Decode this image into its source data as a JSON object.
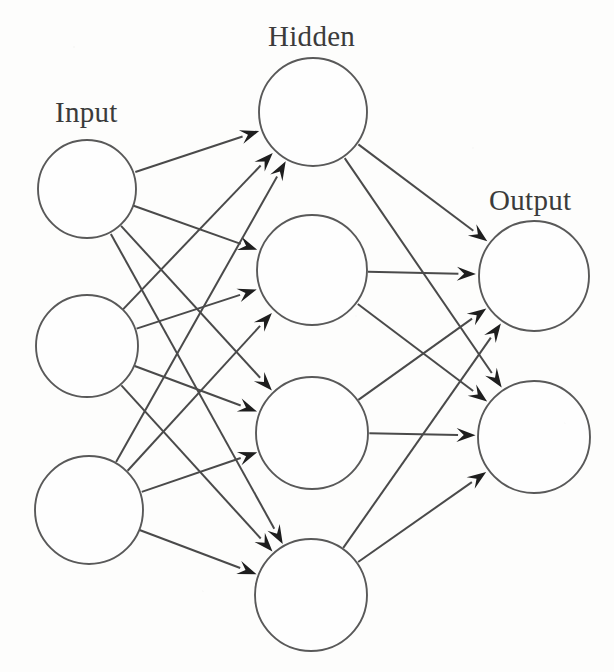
{
  "figure": {
    "type": "neural-network-diagram",
    "title": "",
    "background_color": "#fdfdfc",
    "stroke_color": "#4a4a4a",
    "node_fill_color": "#fefefe",
    "node_stroke_color": "#595959",
    "arrowhead_color": "#1e1e1e",
    "label_color": "#3b3b3b",
    "canvas": {
      "width": 614,
      "height": 672
    }
  },
  "labels": {
    "input": "Input",
    "hidden": "Hidden",
    "output": "Output"
  },
  "label_positions": {
    "input": {
      "x": 55,
      "y": 98
    },
    "hidden": {
      "x": 268,
      "y": 22
    },
    "output": {
      "x": 489,
      "y": 186
    }
  },
  "layers": [
    {
      "id": "input",
      "name": "Input",
      "node_count": 3,
      "nodes": [
        {
          "id": "i1",
          "cx": 87,
          "cy": 189,
          "r": 49
        },
        {
          "id": "i2",
          "cx": 87,
          "cy": 346,
          "r": 51
        },
        {
          "id": "i3",
          "cx": 89,
          "cy": 510,
          "r": 54
        }
      ]
    },
    {
      "id": "hidden",
      "name": "Hidden",
      "node_count": 4,
      "nodes": [
        {
          "id": "h1",
          "cx": 313,
          "cy": 112,
          "r": 54
        },
        {
          "id": "h2",
          "cx": 312,
          "cy": 270,
          "r": 55
        },
        {
          "id": "h3",
          "cx": 312,
          "cy": 433,
          "r": 56
        },
        {
          "id": "h4",
          "cx": 311,
          "cy": 595,
          "r": 56
        }
      ]
    },
    {
      "id": "output",
      "name": "Output",
      "node_count": 2,
      "nodes": [
        {
          "id": "o1",
          "cx": 534,
          "cy": 276,
          "r": 55
        },
        {
          "id": "o2",
          "cx": 534,
          "cy": 437,
          "r": 56
        }
      ]
    }
  ],
  "edges": [
    {
      "from": "i1",
      "to": "h1"
    },
    {
      "from": "i1",
      "to": "h2"
    },
    {
      "from": "i1",
      "to": "h3"
    },
    {
      "from": "i1",
      "to": "h4"
    },
    {
      "from": "i2",
      "to": "h1"
    },
    {
      "from": "i2",
      "to": "h2"
    },
    {
      "from": "i2",
      "to": "h3"
    },
    {
      "from": "i2",
      "to": "h4"
    },
    {
      "from": "i3",
      "to": "h1"
    },
    {
      "from": "i3",
      "to": "h2"
    },
    {
      "from": "i3",
      "to": "h3"
    },
    {
      "from": "i3",
      "to": "h4"
    },
    {
      "from": "h1",
      "to": "o1"
    },
    {
      "from": "h1",
      "to": "o2"
    },
    {
      "from": "h2",
      "to": "o1"
    },
    {
      "from": "h2",
      "to": "o2"
    },
    {
      "from": "h3",
      "to": "o1"
    },
    {
      "from": "h3",
      "to": "o2"
    },
    {
      "from": "h4",
      "to": "o1"
    },
    {
      "from": "h4",
      "to": "o2"
    }
  ],
  "edge_style": {
    "arrowhead_length": 19,
    "arrowhead_half_width": 7,
    "line_width": 2.0,
    "gap_from_target_node": 3,
    "gap_from_source_node": 1
  }
}
